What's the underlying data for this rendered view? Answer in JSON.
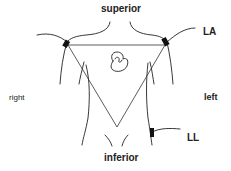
{
  "diagram": {
    "labels": {
      "superior": "superior",
      "inferior": "inferior",
      "right": "right",
      "left": "left",
      "la": "LA",
      "ll": "LL"
    },
    "colors": {
      "ink": "#222222",
      "background": "#ffffff"
    }
  }
}
